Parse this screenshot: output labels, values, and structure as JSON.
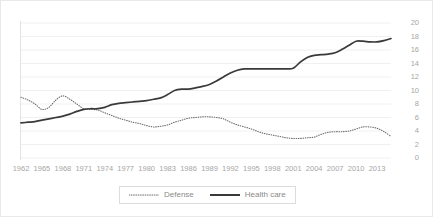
{
  "chart_data": {
    "type": "line",
    "title": "",
    "subtitle": "",
    "xlabel": "",
    "ylabel": "",
    "xlim": [
      1962,
      2015
    ],
    "ylim": [
      0,
      20
    ],
    "y_ticks": [
      0,
      2,
      4,
      6,
      8,
      10,
      12,
      14,
      16,
      18,
      20
    ],
    "x_ticks": [
      1962,
      1965,
      1968,
      1971,
      1974,
      1977,
      1980,
      1983,
      1986,
      1989,
      1992,
      1995,
      1998,
      2001,
      2004,
      2007,
      2010,
      2013
    ],
    "grid": "horizontal",
    "legend_position": "bottom",
    "x": [
      1962,
      1963,
      1964,
      1965,
      1966,
      1967,
      1968,
      1969,
      1970,
      1971,
      1972,
      1973,
      1974,
      1975,
      1976,
      1977,
      1978,
      1979,
      1980,
      1981,
      1982,
      1983,
      1984,
      1985,
      1986,
      1987,
      1988,
      1989,
      1990,
      1991,
      1992,
      1993,
      1994,
      1995,
      1996,
      1997,
      1998,
      1999,
      2000,
      2001,
      2002,
      2003,
      2004,
      2005,
      2006,
      2007,
      2008,
      2009,
      2010,
      2011,
      2012,
      2013,
      2014,
      2015
    ],
    "series": [
      {
        "name": "Defense",
        "style": "dotted",
        "color": "#6b6b6b",
        "values": [
          9.0,
          8.6,
          8.0,
          7.2,
          7.5,
          8.6,
          9.2,
          8.7,
          8.0,
          7.3,
          7.2,
          7.1,
          6.7,
          6.3,
          5.9,
          5.6,
          5.3,
          5.1,
          4.8,
          4.6,
          4.7,
          4.9,
          5.3,
          5.6,
          5.9,
          6.0,
          6.1,
          6.1,
          6.0,
          5.8,
          5.3,
          4.9,
          4.6,
          4.3,
          3.9,
          3.6,
          3.4,
          3.2,
          3.0,
          2.9,
          2.9,
          3.0,
          3.1,
          3.5,
          3.8,
          3.9,
          3.9,
          4.0,
          4.3,
          4.6,
          4.6,
          4.4,
          3.9,
          3.2
        ]
      },
      {
        "name": "Health care",
        "style": "solid",
        "color": "#3a3a3a",
        "values": [
          5.2,
          5.3,
          5.4,
          5.6,
          5.8,
          6.0,
          6.2,
          6.5,
          6.9,
          7.2,
          7.3,
          7.3,
          7.5,
          7.9,
          8.1,
          8.2,
          8.3,
          8.4,
          8.5,
          8.7,
          8.9,
          9.4,
          10.0,
          10.2,
          10.2,
          10.4,
          10.6,
          10.9,
          11.4,
          12.0,
          12.6,
          13.0,
          13.2,
          13.2,
          13.2,
          13.2,
          13.2,
          13.2,
          13.2,
          13.3,
          14.2,
          14.9,
          15.2,
          15.3,
          15.4,
          15.6,
          16.1,
          16.7,
          17.3,
          17.3,
          17.2,
          17.2,
          17.4,
          17.7
        ]
      }
    ]
  },
  "axes": {
    "y_tick_labels": [
      "20",
      "18",
      "16",
      "14",
      "12",
      "10",
      "8",
      "6",
      "4",
      "2",
      "0"
    ],
    "x_tick_labels": [
      "1962",
      "1965",
      "1968",
      "1971",
      "1974",
      "1977",
      "1980",
      "1983",
      "1986",
      "1989",
      "1992",
      "1995",
      "1998",
      "2001",
      "2004",
      "2007",
      "2010",
      "2013"
    ]
  },
  "legend": {
    "items": [
      {
        "label": "Defense",
        "style": "dotted",
        "color": "#6b6b6b"
      },
      {
        "label": "Health care",
        "style": "solid",
        "color": "#3a3a3a"
      }
    ]
  },
  "colors": {
    "defense_line": "#6b6b6b",
    "health_care_line": "#3a3a3a",
    "gridline": "#f0f0f0",
    "axis_text": "#a6a6a6",
    "legend_text": "#8a8a8a",
    "legend_border": "#dcdcdc",
    "figure_border": "#e8e8e8",
    "background": "#ffffff"
  }
}
